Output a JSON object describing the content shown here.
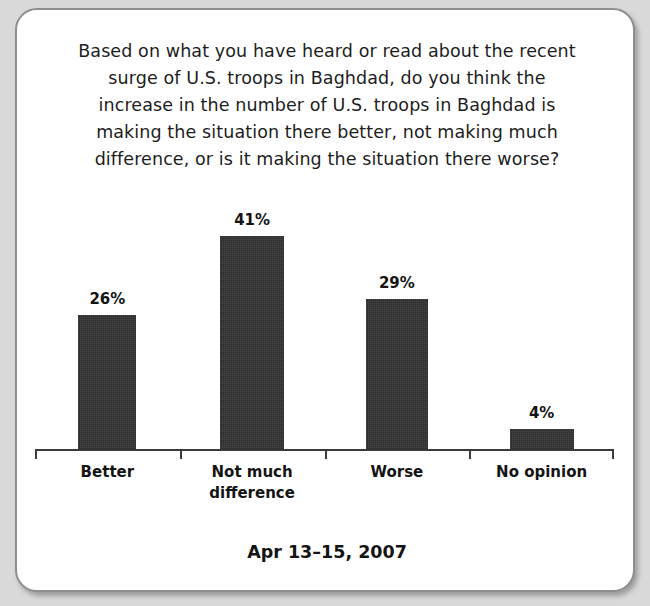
{
  "card": {
    "title_lines": [
      "Based on what you have heard or read about the recent",
      "surge of U.S. troops in Baghdad, do you think the",
      "increase in the number of U.S. troops in Baghdad is",
      "making the situation there better, not making much",
      "difference, or is it making the situation there worse?"
    ],
    "footer": "Apr 13–15, 2007"
  },
  "chart_data": {
    "type": "bar",
    "subtitle": "Apr 13–15, 2007",
    "categories": [
      "Better",
      "Not much difference",
      "Worse",
      "No opinion"
    ],
    "category_lines": [
      [
        "Better"
      ],
      [
        "Not much",
        "difference"
      ],
      [
        "Worse"
      ],
      [
        "No opinion"
      ]
    ],
    "values": [
      26,
      41,
      29,
      4
    ],
    "value_labels": [
      "26%",
      "41%",
      "29%",
      "4%"
    ],
    "unit": "%",
    "xlabel": "",
    "ylabel": "",
    "ylim": [
      0,
      48
    ],
    "grid": false,
    "legend": "none",
    "bar_color": "#2d2d2d",
    "axis_color": "#3b3b3b",
    "background_color": "#ffffff"
  }
}
